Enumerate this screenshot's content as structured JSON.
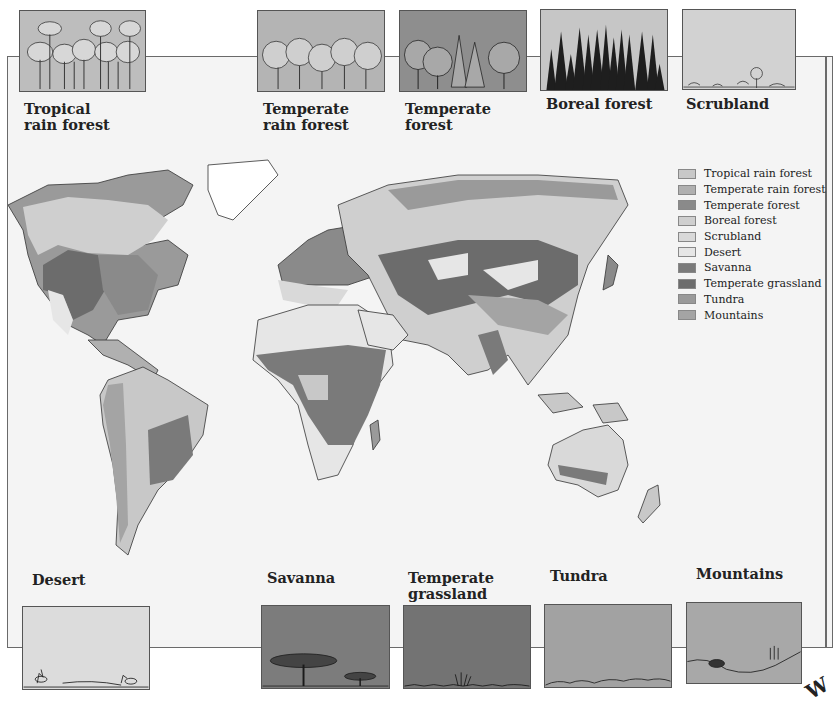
{
  "top_panels": [
    {
      "id": "tropical-rain-forest",
      "label": "Tropical\nrain forest",
      "bg": "#bdbdbd"
    },
    {
      "id": "temperate-rain-forest",
      "label": "Temperate\nrain forest",
      "bg": "#b4b4b4"
    },
    {
      "id": "temperate-forest",
      "label": "Temperate\nforest",
      "bg": "#8e8e8e"
    },
    {
      "id": "boreal-forest",
      "label": "Boreal forest",
      "bg": "#c6c6c6"
    },
    {
      "id": "scrubland",
      "label": "Scrubland",
      "bg": "#d2d2d2"
    }
  ],
  "bottom_panels": [
    {
      "id": "desert",
      "label": "Desert",
      "bg": "#dcdcdc"
    },
    {
      "id": "savanna",
      "label": "Savanna",
      "bg": "#7c7c7c"
    },
    {
      "id": "temperate-grassland",
      "label": "Temperate\ngrassland",
      "bg": "#737373"
    },
    {
      "id": "tundra",
      "label": "Tundra",
      "bg": "#a2a2a2"
    },
    {
      "id": "mountains",
      "label": "Mountains",
      "bg": "#a8a8a8"
    }
  ],
  "legend": {
    "items": [
      {
        "label": "Tropical rain forest",
        "color": "#c8c8c8"
      },
      {
        "label": "Temperate rain forest",
        "color": "#b0b0b0"
      },
      {
        "label": "Temperate forest",
        "color": "#8a8a8a"
      },
      {
        "label": "Boreal forest",
        "color": "#cfcfcf"
      },
      {
        "label": "Scrubland",
        "color": "#d9d9d9"
      },
      {
        "label": "Desert",
        "color": "#e6e6e6"
      },
      {
        "label": "Savanna",
        "color": "#7a7a7a"
      },
      {
        "label": "Temperate grassland",
        "color": "#6c6c6c"
      },
      {
        "label": "Tundra",
        "color": "#9a9a9a"
      },
      {
        "label": "Mountains",
        "color": "#a4a4a4"
      }
    ]
  },
  "corner_mark": "W"
}
